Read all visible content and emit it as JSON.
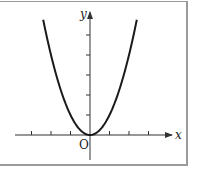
{
  "figure": {
    "axis_labels": {
      "x": "x",
      "y": "y",
      "origin": "O"
    },
    "colors": {
      "curve": "#1a1a1a",
      "axes": "#333333",
      "frame": "#9a9a9a"
    }
  },
  "chart_data": {
    "type": "line",
    "title": "",
    "function": "y = x^2",
    "xlabel": "x",
    "ylabel": "y",
    "origin_label": "O",
    "x_ticks": [
      -3,
      -2,
      -1,
      1,
      2,
      3
    ],
    "y_ticks": [
      1,
      2,
      3,
      4,
      5
    ],
    "xlim": [
      -3.8,
      4.2
    ],
    "ylim": [
      -1.3,
      6.2
    ],
    "x": [
      -2.4,
      -2,
      -1.5,
      -1,
      -0.5,
      0,
      0.5,
      1,
      1.5,
      2,
      2.4
    ],
    "values": [
      5.76,
      4,
      2.25,
      1,
      0.25,
      0,
      0.25,
      1,
      2.25,
      4,
      5.76
    ],
    "grid": false
  }
}
